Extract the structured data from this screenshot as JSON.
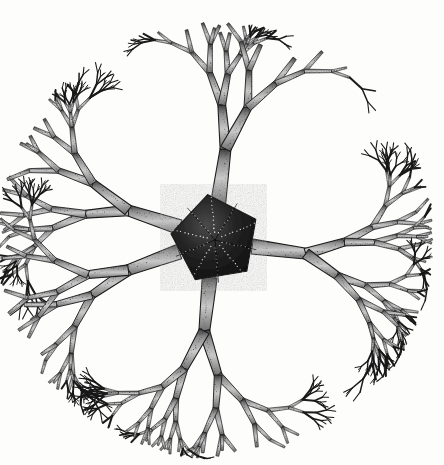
{
  "plate": {
    "title": "Gorgonocephalus — basket star",
    "subject_common_name": "Basket star",
    "subject_genus": "Gorgonocephalus",
    "medium": "ink engraving / stipple drawing",
    "background_color": "#fdfdfc",
    "ink_color": "#1a1a1a",
    "shade_color": "#8c8c8c",
    "width_px": 444,
    "height_px": 465
  },
  "top_rule": {
    "name": "horizontal-rule",
    "x": 5,
    "y": 9,
    "width": 435,
    "thickness": 1,
    "color": "#8d8d8d"
  },
  "organism": {
    "center_x": 215,
    "center_y": 240,
    "canopy_radius": 215,
    "outline_shape": "circular",
    "disc": {
      "name": "central-disc",
      "shape": "pentagonal",
      "radius": 46,
      "rotation_deg": 10,
      "fill": "#1b1b1b",
      "radial_dotted_lines": 10,
      "dot_color": "#f2f2f2"
    },
    "arms": {
      "count": 5,
      "branching": "dichotomous",
      "levels": 9,
      "angles_deg": [
        85,
        160,
        198,
        262,
        350
      ],
      "base_width": 15,
      "taper": 0.72,
      "length_first": 54,
      "length_ratio": 0.8,
      "spread_deg": 33
    }
  },
  "legend": {
    "figure_label": "",
    "caption": ""
  }
}
